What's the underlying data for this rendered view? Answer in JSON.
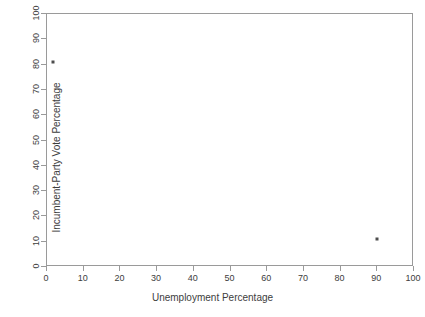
{
  "chart_data": {
    "type": "scatter",
    "title": "",
    "xlabel": "Unemployment Percentage",
    "ylabel": "Incumbent-Party Vote Percentage",
    "xlim": [
      0,
      100
    ],
    "ylim": [
      0,
      100
    ],
    "xticks": [
      0,
      10,
      20,
      30,
      40,
      50,
      60,
      70,
      80,
      90,
      100
    ],
    "yticks": [
      0,
      10,
      20,
      30,
      40,
      50,
      60,
      70,
      80,
      90,
      100
    ],
    "xticklabels": [
      "0",
      "10",
      "20",
      "30",
      "40",
      "50",
      "60",
      "70",
      "80",
      "90",
      "100"
    ],
    "yticklabels": [
      "0",
      "10",
      "20",
      "30",
      "40",
      "50",
      "60",
      "70",
      "80",
      "90",
      "100"
    ],
    "grid": false,
    "legend": null,
    "points": [
      {
        "x": 1.5,
        "y": 81
      },
      {
        "x": 90,
        "y": 11
      }
    ],
    "series": [
      {
        "name": "",
        "x": [
          1.5,
          90
        ],
        "y": [
          81,
          11
        ],
        "marker": "dot",
        "color": "#4d4d4d"
      }
    ],
    "colors": {
      "point": "#4d4d4d",
      "axis": "#9a9a9a",
      "text": "#3d3d3d",
      "background": "#ffffff"
    }
  }
}
